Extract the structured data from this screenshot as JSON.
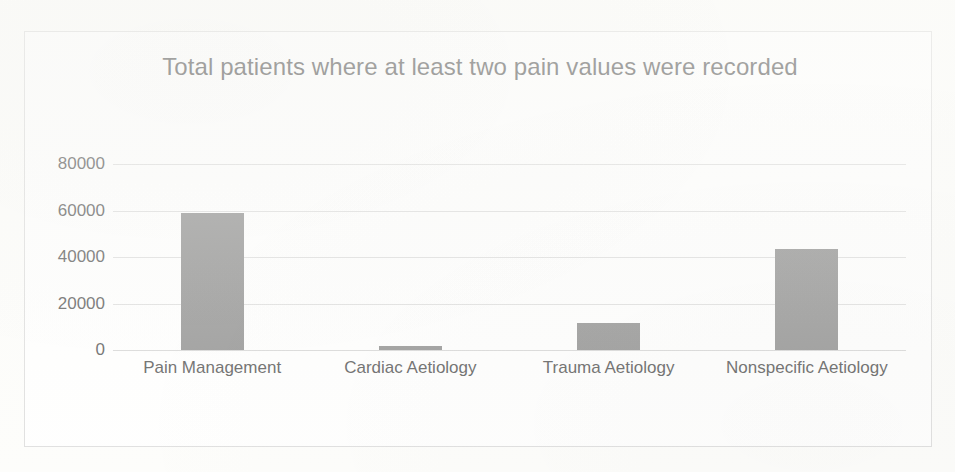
{
  "chart_data": {
    "type": "bar",
    "title": "Total patients where at least two pain values were recorded",
    "categories": [
      "Pain Management",
      "Cardiac Aetiology",
      "Trauma Aetiology",
      "Nonspecific Aetiology"
    ],
    "values": [
      59000,
      1700,
      11800,
      43500
    ],
    "xlabel": "",
    "ylabel": "",
    "ylim": [
      0,
      80000
    ],
    "yticks": [
      0,
      20000,
      40000,
      60000,
      80000
    ],
    "ytick_labels": [
      "0",
      "20000",
      "40000",
      "60000",
      "80000"
    ],
    "grid": true,
    "legend": false,
    "series": [
      {
        "name": "Total patients",
        "values": [
          59000,
          1700,
          11800,
          43500
        ]
      }
    ],
    "colors": {
      "bar": "#808080",
      "gridline": "#d9d9d9",
      "text": "#404040",
      "title": "#3a3a3a",
      "border": "#d9d9d9",
      "plot_background": "#ffffff",
      "page_background": "#fdfdfb"
    }
  }
}
